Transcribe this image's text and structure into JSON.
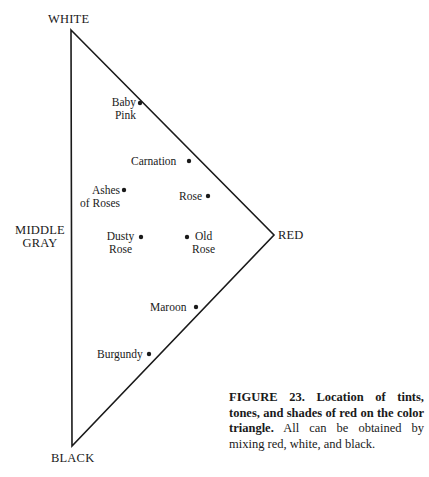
{
  "figure": {
    "vertices": {
      "white": {
        "label": "WHITE",
        "x": 71,
        "y": 30
      },
      "red": {
        "label": "RED",
        "x": 274,
        "y": 235
      },
      "black": {
        "label": "BLACK",
        "x": 72,
        "y": 446
      }
    },
    "side_label": {
      "line1": "MIDDLE",
      "line2": "GRAY"
    },
    "points": [
      {
        "name": "Baby Pink",
        "line1": "Baby",
        "line2": "Pink",
        "x": 140,
        "y": 103
      },
      {
        "name": "Carnation",
        "line1": "Carnation",
        "line2": "",
        "x": 189,
        "y": 161
      },
      {
        "name": "Ashes of Roses",
        "line1": "Ashes",
        "line2": "of Roses",
        "x": 124,
        "y": 190
      },
      {
        "name": "Rose",
        "line1": "Rose",
        "line2": "",
        "x": 208,
        "y": 196
      },
      {
        "name": "Dusty Rose",
        "line1": "Dusty",
        "line2": "Rose",
        "x": 141,
        "y": 237
      },
      {
        "name": "Old Rose",
        "line1": "Old",
        "line2": "Rose",
        "x": 187,
        "y": 237
      },
      {
        "name": "Maroon",
        "line1": "Maroon",
        "line2": "",
        "x": 196,
        "y": 307
      },
      {
        "name": "Burgundy",
        "line1": "Burgundy",
        "line2": "",
        "x": 149,
        "y": 354
      }
    ],
    "line_color": "#1a1a1a"
  },
  "caption": {
    "bold": "FIGURE 23. Location of tints, tones, and shades of red on the color triangle.",
    "text": " All can be obtained by mixing red, white, and black."
  }
}
